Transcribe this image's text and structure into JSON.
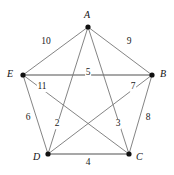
{
  "figure": {
    "name": "weighted-complete-graph-k5",
    "background_color": "#ffffff",
    "edge_color": "#767676",
    "vertex_color": "#111111",
    "label_color": "#1a1a1a"
  },
  "vertices": [
    {
      "id": "A",
      "label": "A",
      "x": 88,
      "y": 27,
      "label_x": 84,
      "label_y": 10
    },
    {
      "id": "B",
      "label": "B",
      "x": 152,
      "y": 75,
      "label_x": 160,
      "label_y": 69
    },
    {
      "id": "C",
      "label": "C",
      "x": 129,
      "y": 154,
      "label_x": 136,
      "label_y": 152
    },
    {
      "id": "D",
      "label": "D",
      "x": 48,
      "y": 154,
      "label_x": 33,
      "label_y": 152
    },
    {
      "id": "E",
      "label": "E",
      "x": 23,
      "y": 75,
      "label_x": 7,
      "label_y": 69
    }
  ],
  "edges": [
    {
      "from": "A",
      "to": "E",
      "weight": "10",
      "label_x": 46,
      "label_y": 42,
      "emphasis": "normal"
    },
    {
      "from": "A",
      "to": "B",
      "weight": "9",
      "label_x": 129,
      "label_y": 42,
      "emphasis": "normal"
    },
    {
      "from": "E",
      "to": "B",
      "weight": "5",
      "label_x": 88,
      "label_y": 73,
      "emphasis": "thick"
    },
    {
      "from": "E",
      "to": "C",
      "weight": "11",
      "label_x": 42,
      "label_y": 87,
      "emphasis": "normal"
    },
    {
      "from": "B",
      "to": "D",
      "weight": "7",
      "label_x": 133,
      "label_y": 87,
      "emphasis": "normal"
    },
    {
      "from": "E",
      "to": "D",
      "weight": "6",
      "label_x": 28,
      "label_y": 118,
      "emphasis": "normal"
    },
    {
      "from": "A",
      "to": "D",
      "weight": "2",
      "label_x": 57,
      "label_y": 124,
      "emphasis": "normal"
    },
    {
      "from": "A",
      "to": "C",
      "weight": "3",
      "label_x": 118,
      "label_y": 124,
      "emphasis": "normal"
    },
    {
      "from": "B",
      "to": "C",
      "weight": "8",
      "label_x": 148,
      "label_y": 118,
      "emphasis": "normal"
    },
    {
      "from": "D",
      "to": "C",
      "weight": "4",
      "label_x": 88,
      "label_y": 163,
      "emphasis": "thick"
    }
  ],
  "chart_data": {
    "type": "diagram",
    "title": "",
    "graph_type": "complete-graph-K5-weighted",
    "nodes": [
      "A",
      "B",
      "C",
      "D",
      "E"
    ],
    "edge_list": [
      {
        "pair": "A-E",
        "weight": 10
      },
      {
        "pair": "A-B",
        "weight": 9
      },
      {
        "pair": "E-B",
        "weight": 5
      },
      {
        "pair": "E-C",
        "weight": 11
      },
      {
        "pair": "B-D",
        "weight": 7
      },
      {
        "pair": "E-D",
        "weight": 6
      },
      {
        "pair": "A-D",
        "weight": 2
      },
      {
        "pair": "A-C",
        "weight": 3
      },
      {
        "pair": "B-C",
        "weight": 8
      },
      {
        "pair": "D-C",
        "weight": 4
      }
    ],
    "weights": [
      10,
      9,
      5,
      11,
      7,
      6,
      2,
      3,
      8,
      4
    ],
    "legend": [],
    "xlabel": "",
    "ylabel": ""
  }
}
